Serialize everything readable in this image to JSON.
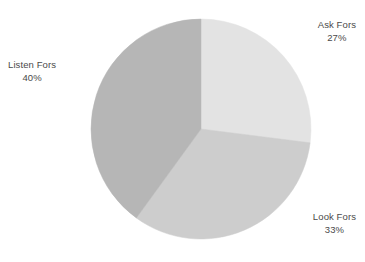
{
  "chart_data": {
    "type": "pie",
    "title": "",
    "subtitle": "",
    "xlabel": "",
    "ylabel": "",
    "grid": false,
    "legend_position": "none",
    "label_format": "name-above-percent",
    "start_angle_deg": 0,
    "direction": "clockwise",
    "background_color": "#ffffff",
    "label_text_color": "#4a4a4a",
    "categories": [
      "Ask Fors",
      "Look Fors",
      "Listen Fors"
    ],
    "values": [
      27,
      33,
      40
    ],
    "units": "%",
    "total": 100,
    "slices": [
      {
        "name": "Ask Fors",
        "value": 27,
        "value_label": "27%",
        "color": "#e3e3e3",
        "start_angle_deg": 0,
        "end_angle_deg": 97.2
      },
      {
        "name": "Look Fors",
        "value": 33,
        "value_label": "33%",
        "color": "#cdcdcd",
        "start_angle_deg": 97.2,
        "end_angle_deg": 216.0
      },
      {
        "name": "Listen Fors",
        "value": 40,
        "value_label": "40%",
        "color": "#b6b6b6",
        "start_angle_deg": 216.0,
        "end_angle_deg": 360.0
      }
    ]
  },
  "labels": {
    "ask": {
      "name": "Ask Fors",
      "value": "27%"
    },
    "look": {
      "name": "Look Fors",
      "value": "33%"
    },
    "listen": {
      "name": "Listen Fors",
      "value": "40%"
    }
  },
  "geometry": {
    "center_x": 201,
    "center_y": 129,
    "radius": 110
  }
}
